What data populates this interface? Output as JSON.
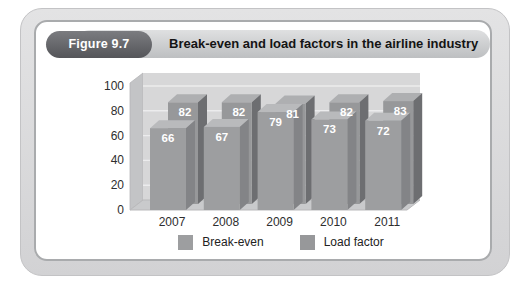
{
  "header": {
    "figure_label": "Figure 9.7",
    "title": "Break-even and load factors in the airline industry"
  },
  "chart_data": {
    "type": "bar",
    "style": "3d-grouped-grayscale",
    "title": "Break-even and load factors in the airline industry",
    "xlabel": "",
    "ylabel": "",
    "categories": [
      "2007",
      "2008",
      "2009",
      "2010",
      "2011"
    ],
    "series": [
      {
        "name": "Break-even",
        "values": [
          66,
          67,
          79,
          73,
          72
        ],
        "color": {
          "front": "#9d9ea0",
          "side": "#838487",
          "top": "#b9babc"
        }
      },
      {
        "name": "Load factor",
        "values": [
          82,
          82,
          81,
          82,
          83
        ],
        "color": {
          "front": "#97989a",
          "side": "#6d6e71",
          "top": "#aeafb1"
        }
      }
    ],
    "ylim": [
      0,
      100
    ],
    "yticks": [
      0,
      20,
      40,
      60,
      80,
      100
    ],
    "grid": true,
    "legend_position": "bottom",
    "bar_value_labels": true,
    "label_color": "#ffffff",
    "palette": {
      "wall_back": "#d7d7d8",
      "wall_left": "#c3c4c6",
      "floor": "#c9cacc",
      "floor_edge": "#b9b9bb",
      "grid": "#ececed",
      "axis_text": "#2e2e2e"
    }
  }
}
